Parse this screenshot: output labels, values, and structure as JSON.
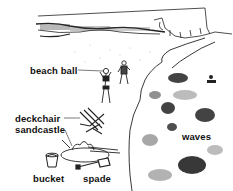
{
  "figure": {
    "colors": {
      "ink": "#111111",
      "background": "#ffffff"
    }
  },
  "labels": {
    "beach_ball": "beach ball",
    "deckchair": "deckchair",
    "sandcastle": "sandcastle",
    "bucket": "bucket",
    "spade": "spade",
    "waves": "waves"
  }
}
